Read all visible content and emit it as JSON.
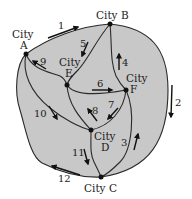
{
  "diagram": {
    "type": "road-network",
    "colors": {
      "region_fill": "#c8c8c8",
      "stroke": "#2a2a2a",
      "background": "#ffffff"
    },
    "cities": [
      {
        "id": "A",
        "line1": "City",
        "line2": "A"
      },
      {
        "id": "B",
        "label": "City B"
      },
      {
        "id": "C",
        "label": "City C"
      },
      {
        "id": "D",
        "line1": "City",
        "line2": "D"
      },
      {
        "id": "E",
        "line1": "City",
        "line2": "E"
      },
      {
        "id": "F",
        "line1": "City",
        "line2": "F"
      }
    ],
    "roads": [
      {
        "number": "1",
        "from": "A",
        "to": "B"
      },
      {
        "number": "2",
        "from": "B",
        "to": "C"
      },
      {
        "number": "3",
        "from": "C",
        "to": "F"
      },
      {
        "number": "4",
        "from": "F",
        "to": "B"
      },
      {
        "number": "5",
        "from": "B",
        "to": "E"
      },
      {
        "number": "6",
        "from": "E",
        "to": "F"
      },
      {
        "number": "7",
        "from": "F",
        "to": "D"
      },
      {
        "number": "8",
        "from": "D",
        "to": "E"
      },
      {
        "number": "9",
        "from": "E",
        "to": "A"
      },
      {
        "number": "10",
        "from": "A",
        "to": "D"
      },
      {
        "number": "11",
        "from": "D",
        "to": "C"
      },
      {
        "number": "12",
        "from": "C",
        "to": "A"
      }
    ]
  }
}
